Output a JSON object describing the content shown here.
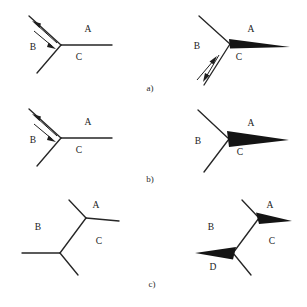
{
  "figure": {
    "background_color": "#ffffff",
    "ink_color": "#262626",
    "wedge_color": "#141414",
    "width": 307,
    "height": 307,
    "panels": [
      {
        "caption": "a)",
        "caption_pos": [
          150,
          89
        ],
        "diagrams": [
          {
            "id": "a-left",
            "junction": [
              61,
              45
            ],
            "branches": [
              {
                "label": "A",
                "label_pos": [
                  88,
                  30
                ],
                "end": [
                  112,
                  45
                ],
                "style": "line"
              },
              {
                "label": "B",
                "label_pos": [
                  33,
                  48
                ],
                "end": [
                  29,
                  16
                ],
                "style": "line"
              },
              {
                "label": "C",
                "label_pos": [
                  79,
                  58
                ],
                "end": [
                  37,
                  73
                ],
                "style": "line"
              }
            ],
            "arrows": [
              {
                "on": "B",
                "from": [
                  56,
                  42
                ],
                "to": [
                  32,
                  21
                ],
                "direction": "outward"
              },
              {
                "on": "B",
                "from": [
                  33,
                  30
                ],
                "to": [
                  56,
                  49
                ],
                "direction": "inward"
              }
            ],
            "wedges": []
          },
          {
            "id": "a-right",
            "junction": [
              230,
              44
            ],
            "branches": [
              {
                "label": "A",
                "label_pos": [
                  251,
                  30
                ],
                "end": [
                  290,
                  47
                ],
                "style": "wedge"
              },
              {
                "label": "B",
                "label_pos": [
                  197,
                  47
                ],
                "end": [
                  199,
                  16
                ],
                "style": "line"
              },
              {
                "label": "C",
                "label_pos": [
                  239,
                  58
                ],
                "end": [
                  204,
                  85
                ],
                "style": "line"
              }
            ],
            "arrows": [
              {
                "on": "C",
                "from": [
                  196,
                  81
                ],
                "to": [
                  216,
                  57
                ],
                "direction": "inward"
              },
              {
                "on": "C",
                "from": [
                  219,
                  54
                ],
                "to": [
                  203,
                  81
                ],
                "direction": "outward"
              }
            ],
            "wedges": [
              {
                "on": "A",
                "tip": [
                  290,
                  47
                ],
                "base_a": [
                  229,
                  39
                ],
                "base_b": [
                  230,
                  48
                ]
              }
            ]
          }
        ]
      },
      {
        "caption": "b)",
        "caption_pos": [
          150,
          180
        ],
        "diagrams": [
          {
            "id": "b-left",
            "junction": [
              61,
              138
            ],
            "branches": [
              {
                "label": "A",
                "label_pos": [
                  88,
                  123
                ],
                "end": [
                  112,
                  138
                ],
                "style": "line"
              },
              {
                "label": "B",
                "label_pos": [
                  33,
                  141
                ],
                "end": [
                  29,
                  109
                ],
                "style": "line"
              },
              {
                "label": "C",
                "label_pos": [
                  79,
                  151
                ],
                "end": [
                  37,
                  166
                ],
                "style": "line"
              }
            ],
            "arrows": [
              {
                "on": "B",
                "from": [
                  56,
                  135
                ],
                "to": [
                  32,
                  114
                ],
                "direction": "outward"
              },
              {
                "on": "B",
                "from": [
                  33,
                  123
                ],
                "to": [
                  56,
                  142
                ],
                "direction": "inward"
              }
            ],
            "wedges": []
          },
          {
            "id": "b-right",
            "junction": [
              229,
              139
            ],
            "branches": [
              {
                "label": "A",
                "label_pos": [
                  251,
                  124
                ],
                "end": [
                  289,
                  140
                ],
                "style": "wedge"
              },
              {
                "label": "B",
                "label_pos": [
                  198,
                  142
                ],
                "end": [
                  198,
                  110
                ],
                "style": "line"
              },
              {
                "label": "C",
                "label_pos": [
                  240,
                  153
                ],
                "end": [
                  204,
                  172
                ],
                "style": "line"
              }
            ],
            "arrows": [],
            "wedges": [
              {
                "on": "A",
                "tip": [
                  289,
                  140
                ],
                "base_a": [
                  227,
                  131
                ],
                "base_b": [
                  229,
                  146
                ]
              }
            ]
          }
        ]
      },
      {
        "caption": "c)",
        "caption_pos": [
          152,
          285
        ],
        "diagrams": [
          {
            "id": "c-left",
            "junction_upper": [
              86,
              218
            ],
            "junction_lower": [
              60,
              253
            ],
            "branches": [
              {
                "label": "A",
                "label_pos": [
                  96,
                  206
                ],
                "from": [
                  86,
                  218
                ],
                "end": [
                  119,
                  221
                ],
                "style": "line"
              },
              {
                "label": "B",
                "label_pos": [
                  38,
                  228
                ],
                "from": [
                  60,
                  253
                ],
                "end": [
                  22,
                  253
                ],
                "style": "line"
              },
              {
                "label": "C",
                "label_pos": [
                  99,
                  242
                ],
                "from": [
                  60,
                  253
                ],
                "end": [
                  78,
                  275
                ],
                "style": "line"
              }
            ],
            "extra_edges": [
              {
                "from": [
                  86,
                  218
                ],
                "to": [
                  69,
                  200
                ]
              },
              {
                "from": [
                  86,
                  218
                ],
                "to": [
                  60,
                  253
                ]
              }
            ],
            "wedges": []
          },
          {
            "id": "c-right",
            "junction_upper": [
              259,
              218
            ],
            "junction_lower": [
              233,
              253
            ],
            "branches": [
              {
                "label": "A",
                "label_pos": [
                  270,
                  206
                ],
                "from": [
                  259,
                  218
                ],
                "end": [
                  292,
                  221
                ],
                "style": "wedge"
              },
              {
                "label": "B",
                "label_pos": [
                  211,
                  228
                ],
                "from": [
                  233,
                  253
                ],
                "end": [
                  195,
                  253
                ],
                "style": "wedge"
              },
              {
                "label": "C",
                "label_pos": [
                  272,
                  242
                ],
                "from": [
                  233,
                  253
                ],
                "end": [
                  251,
                  275
                ],
                "style": "line"
              },
              {
                "label": "D",
                "label_pos": [
                  213,
                  268
                ],
                "from": [
                  233,
                  253
                ],
                "end": [
                  195,
                  253
                ],
                "style": "wedge-label"
              }
            ],
            "extra_edges": [
              {
                "from": [
                  259,
                  218
                ],
                "to": [
                  242,
                  200
                ]
              },
              {
                "from": [
                  259,
                  218
                ],
                "to": [
                  233,
                  253
                ]
              }
            ],
            "wedges": [
              {
                "on": "A",
                "tip": [
                  292,
                  221
                ],
                "base_a": [
                  256,
                  213
                ],
                "base_b": [
                  259,
                  224
                ]
              },
              {
                "on": "D",
                "tip": [
                  195,
                  253
                ],
                "base_a": [
                  235,
                  247
                ],
                "base_b": [
                  233,
                  259
                ]
              }
            ]
          }
        ]
      }
    ]
  }
}
